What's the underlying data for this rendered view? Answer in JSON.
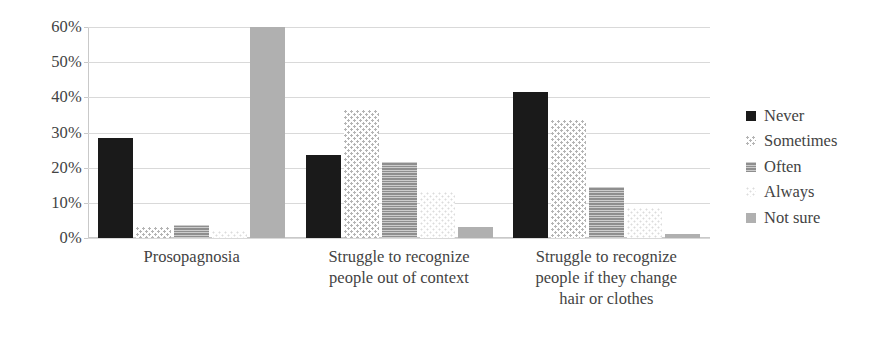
{
  "chart_data": {
    "type": "bar",
    "title": "",
    "xlabel": "",
    "ylabel": "",
    "ylim": [
      0,
      60
    ],
    "ytick_labels": [
      "0%",
      "10%",
      "20%",
      "30%",
      "40%",
      "50%",
      "60%"
    ],
    "ytick_values": [
      0,
      10,
      20,
      30,
      40,
      50,
      60
    ],
    "grid": true,
    "legend_position": "right",
    "categories": [
      "Prosopagnosia",
      "Struggle to recognize people out of context",
      "Struggle to recognize people if they change hair or clothes"
    ],
    "category_lines": [
      [
        "Prosopagnosia"
      ],
      [
        "Struggle to recognize",
        "people out of context"
      ],
      [
        "Struggle to recognize",
        "people if they change",
        "hair or clothes"
      ]
    ],
    "series": [
      {
        "name": "Never",
        "values": [
          28.5,
          23.5,
          41.5
        ],
        "color": "#1a1a1a",
        "pattern": "solid-black"
      },
      {
        "name": "Sometimes",
        "values": [
          3.0,
          36.5,
          33.5
        ],
        "color": "#b4b4b4",
        "pattern": "dots"
      },
      {
        "name": "Often",
        "values": [
          3.8,
          21.5,
          14.5
        ],
        "color": "#8e8e8e",
        "pattern": "horizontal-hatch"
      },
      {
        "name": "Always",
        "values": [
          2.0,
          13.0,
          8.5
        ],
        "color": "#dcdcdc",
        "pattern": "light-dots"
      },
      {
        "name": "Not sure",
        "values": [
          60.0,
          3.0,
          1.0
        ],
        "color": "#b0b0b0",
        "pattern": "solid-gray"
      }
    ]
  },
  "legend": {
    "items": [
      {
        "label": "Never"
      },
      {
        "label": "Sometimes"
      },
      {
        "label": "Often"
      },
      {
        "label": "Always"
      },
      {
        "label": "Not sure"
      }
    ]
  }
}
